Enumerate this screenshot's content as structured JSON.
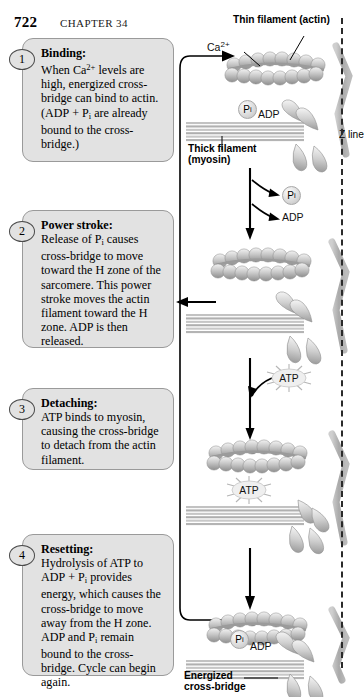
{
  "header": {
    "folio": "722",
    "chapter": "CHAPTER 34"
  },
  "steps": [
    {
      "number": "1",
      "title": "Binding:",
      "body": "When Ca2+ levels are high, energized cross-bridge can bind to actin. (ADP + Pi are already bound to the cross-bridge.)"
    },
    {
      "number": "2",
      "title": "Power stroke:",
      "body": "Release of Pi causes cross-bridge to move toward the H zone of the sarcomere. This power stroke moves the actin filament toward the H zone. ADP is then released."
    },
    {
      "number": "3",
      "title": "Detaching:",
      "body": "ATP binds to myosin, causing the cross-bridge to detach from the actin filament."
    },
    {
      "number": "4",
      "title": "Resetting:",
      "body": "Hydrolysis of ATP to ADP + Pi provides energy, which causes the cross-bridge to move away from the H zone. ADP and Pi remain bound to the cross-bridge. Cycle can begin again."
    }
  ],
  "diagram": {
    "thin_filament_label": "Thin filament (actin)",
    "thick_filament_label_line1": "Thick filament",
    "thick_filament_label_line2": "(myosin)",
    "z_line_label": "Z line",
    "energized_label_line1": "Energized",
    "energized_label_line2": "cross-bridge",
    "calcium_label": "Ca2+",
    "panel1_pi": "Pi",
    "panel1_adp": "ADP",
    "release_pi": "Pi",
    "release_adp": "ADP",
    "atp_binding": "ATP",
    "atp_bound": "ATP",
    "panel4_pi": "Pi",
    "panel4_adp": "ADP"
  },
  "colors": {
    "box_fill": "#e2e2e2",
    "box_border": "#9a9a9a",
    "ink": "#000000",
    "filament": "#b9b9b9",
    "zline": "#2b2b2b"
  }
}
